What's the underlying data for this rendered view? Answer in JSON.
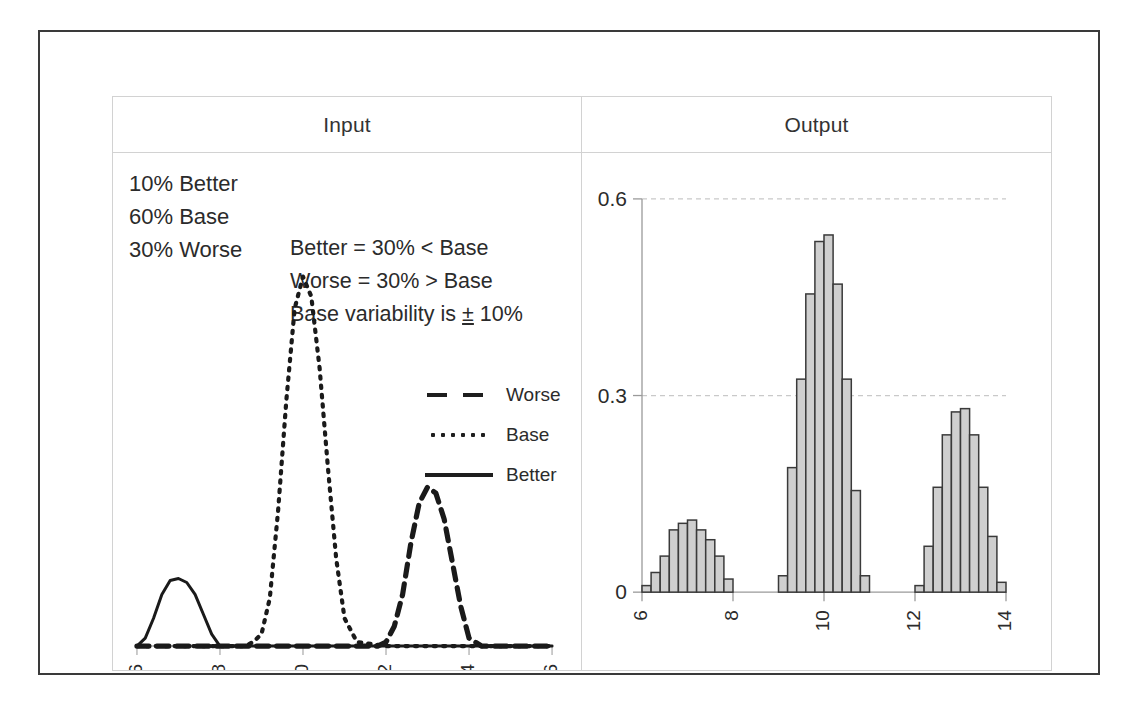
{
  "figure": {
    "columns": [
      {
        "header": "Input"
      },
      {
        "header": "Output"
      }
    ],
    "input_panel": {
      "mix_lines": [
        "10% Better",
        "60% Base",
        "30% Worse"
      ],
      "rule_lines": [
        "Better = 30% < Base",
        "Worse = 30% > Base",
        "Base variability is "
      ],
      "rule_last_suffix": " 10%",
      "plusminus": "±",
      "legend": [
        {
          "label": "Worse",
          "style": "dashed"
        },
        {
          "label": "Base",
          "style": "dotted"
        },
        {
          "label": "Better",
          "style": "solid"
        }
      ]
    }
  },
  "chart_data": [
    {
      "type": "line",
      "title": "Input",
      "xlabel": "",
      "ylabel": "",
      "xlim": [
        6,
        16
      ],
      "ylim": [
        0,
        1
      ],
      "xticks": [
        6,
        8,
        10,
        12,
        14,
        16
      ],
      "xticklabels": [
        "6",
        "8",
        "10",
        "12",
        "14",
        "16"
      ],
      "yticks": [],
      "grid": false,
      "legend_position": "inside-right",
      "series": [
        {
          "name": "Better",
          "style": "solid",
          "peak_x": 7.0,
          "peak_y": 0.17,
          "x": [
            6.0,
            6.2,
            6.4,
            6.6,
            6.8,
            7.0,
            7.2,
            7.4,
            7.6,
            7.8,
            8.0,
            8.4,
            9.0,
            10.0,
            12.0,
            14.0,
            16.0
          ],
          "y": [
            0.0,
            0.02,
            0.07,
            0.13,
            0.165,
            0.17,
            0.16,
            0.13,
            0.08,
            0.03,
            0.0,
            0.0,
            0.0,
            0.0,
            0.0,
            0.0,
            0.0
          ]
        },
        {
          "name": "Base",
          "style": "dotted",
          "peak_x": 10.0,
          "peak_y": 0.93,
          "x": [
            6.0,
            8.6,
            8.8,
            9.0,
            9.2,
            9.4,
            9.6,
            9.8,
            10.0,
            10.2,
            10.4,
            10.6,
            10.8,
            11.0,
            11.3,
            12.0,
            16.0
          ],
          "y": [
            0.0,
            0.0,
            0.01,
            0.03,
            0.12,
            0.34,
            0.62,
            0.85,
            0.93,
            0.88,
            0.7,
            0.45,
            0.22,
            0.07,
            0.01,
            0.0,
            0.0
          ]
        },
        {
          "name": "Worse",
          "style": "dashed",
          "peak_x": 13.0,
          "peak_y": 0.4,
          "x": [
            6.0,
            11.8,
            12.0,
            12.2,
            12.4,
            12.6,
            12.8,
            13.0,
            13.2,
            13.4,
            13.6,
            13.8,
            14.0,
            14.3,
            16.0
          ],
          "y": [
            0.0,
            0.0,
            0.01,
            0.05,
            0.13,
            0.26,
            0.36,
            0.4,
            0.385,
            0.32,
            0.21,
            0.1,
            0.02,
            0.0,
            0.0
          ]
        }
      ]
    },
    {
      "type": "bar",
      "title": "Output",
      "xlabel": "",
      "ylabel": "",
      "xlim": [
        6,
        14
      ],
      "ylim": [
        0,
        0.6
      ],
      "xticks": [
        6,
        8,
        10,
        12,
        14
      ],
      "xticklabels": [
        "6",
        "8",
        "10",
        "12",
        "14"
      ],
      "yticks": [
        0,
        0.3,
        0.6
      ],
      "yticklabels": [
        "0",
        "0.3",
        "0.6"
      ],
      "grid": true,
      "bin_width": 0.2,
      "bar_fill": "#cfcfcf",
      "bar_edge": "#3a3a3a",
      "bin_left_edges": [
        6.0,
        6.2,
        6.4,
        6.6,
        6.8,
        7.0,
        7.2,
        7.4,
        7.6,
        7.8,
        8.0,
        8.2,
        8.4,
        8.6,
        8.8,
        9.0,
        9.2,
        9.4,
        9.6,
        9.8,
        10.0,
        10.2,
        10.4,
        10.6,
        10.8,
        11.0,
        11.2,
        11.4,
        11.6,
        11.8,
        12.0,
        12.2,
        12.4,
        12.6,
        12.8,
        13.0,
        13.2,
        13.4,
        13.6,
        13.8
      ],
      "values": [
        0.01,
        0.03,
        0.055,
        0.095,
        0.105,
        0.11,
        0.095,
        0.08,
        0.055,
        0.02,
        0.0,
        0.0,
        0.0,
        0.0,
        0.0,
        0.025,
        0.19,
        0.325,
        0.455,
        0.535,
        0.545,
        0.47,
        0.325,
        0.155,
        0.025,
        0.0,
        0.0,
        0.0,
        0.0,
        0.0,
        0.01,
        0.07,
        0.16,
        0.24,
        0.275,
        0.28,
        0.24,
        0.16,
        0.085,
        0.015
      ]
    }
  ]
}
